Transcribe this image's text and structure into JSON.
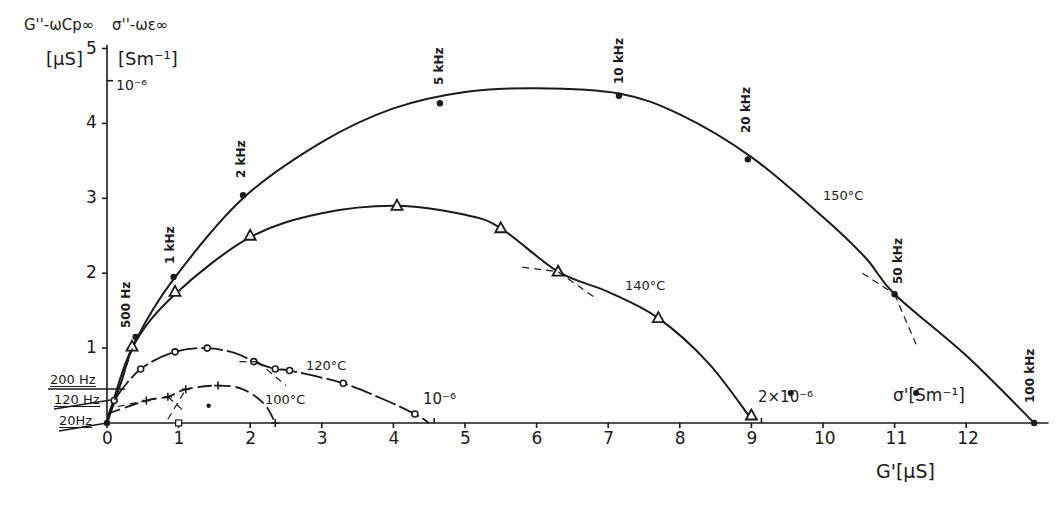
{
  "chart_data": {
    "type": "line",
    "title": "",
    "subtitle": "Complex conductance (Cole-Cole type) plot at various temperatures",
    "xlabel": "G' [µS]",
    "xlabel_secondary": "σ' [Sm⁻¹]",
    "ylabel": "G'' − ωCp∞ [µS]",
    "ylabel_secondary": "σ'' − ωε∞ [Sm⁻¹]",
    "xlim": [
      0,
      13
    ],
    "ylim": [
      0,
      5
    ],
    "x_ticks": [
      "0",
      "1",
      "2",
      "3",
      "4",
      "5",
      "6",
      "7",
      "8",
      "9",
      "10",
      "11",
      "12"
    ],
    "y_ticks": [
      "1",
      "2",
      "3",
      "4",
      "5"
    ],
    "secondary_axis_marks": {
      "y": {
        "label": "10⁻⁶",
        "value": 4.57
      },
      "x": [
        {
          "label": "10⁻⁶",
          "value": 4.57
        },
        {
          "label": "2×10⁻⁶",
          "value": 9.14
        }
      ]
    },
    "grid": false,
    "legend": "inline curve labels",
    "series": [
      {
        "name": "150°C",
        "marker": "filled-circle",
        "x": [
          0,
          0.4,
          0.93,
          1.9,
          4.65,
          7.15,
          8.95,
          11.0,
          12.95
        ],
        "y": [
          0,
          1.15,
          1.95,
          3.04,
          4.27,
          4.37,
          3.52,
          1.72,
          0
        ],
        "point_labels": [
          "20 Hz",
          "500 Hz",
          "1 kHz",
          "2 kHz",
          "5 kHz",
          "10 kHz",
          "20 kHz",
          "50 kHz",
          "100 kHz"
        ],
        "curve": [
          [
            0,
            0
          ],
          [
            0.2,
            0.55
          ],
          [
            0.4,
            1.1
          ],
          [
            0.93,
            1.92
          ],
          [
            1.9,
            3.0
          ],
          [
            3.0,
            3.75
          ],
          [
            4.0,
            4.2
          ],
          [
            5.0,
            4.42
          ],
          [
            6.0,
            4.47
          ],
          [
            7.15,
            4.4
          ],
          [
            8.0,
            4.12
          ],
          [
            9.0,
            3.55
          ],
          [
            10.0,
            2.75
          ],
          [
            10.6,
            2.2
          ],
          [
            11.0,
            1.72
          ],
          [
            12.0,
            0.9
          ],
          [
            12.95,
            0
          ]
        ]
      },
      {
        "name": "140°C",
        "marker": "triangle",
        "x": [
          0.35,
          0.95,
          2.0,
          4.05,
          5.5,
          6.3,
          7.7,
          9.0
        ],
        "y": [
          1.02,
          1.75,
          2.5,
          2.9,
          2.6,
          2.02,
          1.4,
          0.1
        ],
        "curve": [
          [
            0,
            0
          ],
          [
            0.35,
            1.0
          ],
          [
            0.95,
            1.72
          ],
          [
            2.0,
            2.48
          ],
          [
            3.0,
            2.8
          ],
          [
            4.05,
            2.9
          ],
          [
            5.0,
            2.78
          ],
          [
            5.5,
            2.6
          ],
          [
            6.3,
            2.02
          ],
          [
            7.0,
            1.75
          ],
          [
            7.7,
            1.4
          ],
          [
            8.4,
            0.8
          ],
          [
            9.0,
            0.05
          ]
        ]
      },
      {
        "name": "120°C",
        "marker": "open-circle",
        "x": [
          0.1,
          0.47,
          0.95,
          1.4,
          2.05,
          2.35,
          2.55,
          3.3,
          4.3
        ],
        "y": [
          0.3,
          0.72,
          0.95,
          1.0,
          0.82,
          0.72,
          0.7,
          0.53,
          0.12
        ],
        "curve": [
          [
            0,
            0
          ],
          [
            0.1,
            0.3
          ],
          [
            0.47,
            0.72
          ],
          [
            0.95,
            0.95
          ],
          [
            1.4,
            1.0
          ],
          [
            1.8,
            0.93
          ],
          [
            2.05,
            0.82
          ],
          [
            2.35,
            0.72
          ],
          [
            2.55,
            0.7
          ],
          [
            3.3,
            0.53
          ],
          [
            3.9,
            0.3
          ],
          [
            4.3,
            0.12
          ],
          [
            4.5,
            0
          ]
        ]
      },
      {
        "name": "100°C",
        "marker": "plus",
        "x": [
          0.55,
          0.85,
          1.1,
          1.55,
          2.35
        ],
        "y": [
          0.3,
          0.35,
          0.45,
          0.5,
          0
        ],
        "curve": [
          [
            0,
            0.12
          ],
          [
            0.55,
            0.3
          ],
          [
            0.85,
            0.35
          ],
          [
            1.1,
            0.45
          ],
          [
            1.55,
            0.5
          ],
          [
            1.9,
            0.45
          ],
          [
            2.2,
            0.25
          ],
          [
            2.35,
            0
          ]
        ]
      }
    ],
    "annotations": [
      "20Hz",
      "120 Hz",
      "200 Hz",
      "500 Hz",
      "1 kHz",
      "2 kHz",
      "5 kHz",
      "10 kHz",
      "20 kHz",
      "50 kHz",
      "100 kHz",
      "150°C",
      "140°C",
      "120°C",
      "100°C"
    ]
  },
  "labels": {
    "y_left_title": "G''-ωCp∞",
    "y_left_unit": "[µS]",
    "y_right_title": "σ''-ωε∞",
    "y_right_unit": "[Sm⁻¹]",
    "y_secondary_mark": "10⁻⁶",
    "x_title": "G'[µS]",
    "x_secondary_title": "σ'[Sm⁻¹]",
    "x_mark_1": "10⁻⁶",
    "x_mark_2": "2×10⁻⁶",
    "freq_20hz": "20Hz",
    "freq_120hz": "120 Hz",
    "freq_200hz": "200 Hz",
    "freq_500hz": "500 Hz",
    "freq_1k": "1 kHz",
    "freq_2k": "2 kHz",
    "freq_5k": "5 kHz",
    "freq_10k": "10 kHz",
    "freq_20k": "20 kHz",
    "freq_50k": "50 kHz",
    "freq_100k": "100 kHz",
    "t150": "150°C",
    "t140": "140°C",
    "t120": "120°C",
    "t100": "100°C"
  },
  "colors": {
    "ink": "#1a1a1a",
    "background": "#ffffff"
  }
}
